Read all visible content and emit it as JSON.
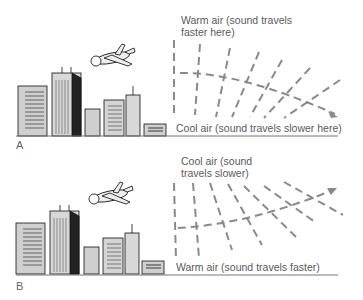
{
  "panels": [
    {
      "id": "A",
      "letter": "A",
      "top_label_line1": "Warm air (sound travels",
      "top_label_line2": "faster here)",
      "bottom_label": "Cool air (sound travels slower here)",
      "ray_direction": "bends downward"
    },
    {
      "id": "B",
      "letter": "B",
      "top_label_line1": "Cool air (sound",
      "top_label_line2": "travels slower)",
      "bottom_label": "Warm air (sound travels faster)",
      "ray_direction": "bends upward"
    }
  ],
  "colors": {
    "dash": "#8a8a8a",
    "ground": "#777777",
    "text": "#5a5a5a"
  }
}
